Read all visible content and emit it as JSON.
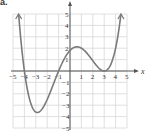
{
  "panel_label": "a.",
  "chart_data": {
    "type": "line",
    "title": "",
    "xlabel": "x",
    "ylabel": "y",
    "xlim": [
      -5,
      5
    ],
    "ylim": [
      -5,
      5
    ],
    "grid": true,
    "x_ticks": [
      -5,
      -4,
      -3,
      -2,
      -1,
      1,
      2,
      3,
      4,
      5
    ],
    "y_ticks": [
      -5,
      -4,
      -3,
      -2,
      -1,
      1,
      2,
      3,
      4,
      5
    ],
    "function": "f(x) = 0.05 (x+4)(x+1)(x-3)^2",
    "zeros": [
      -4,
      -1,
      3
    ],
    "key_points": [
      {
        "label": "local min",
        "x": -2.9,
        "y": -3.6
      },
      {
        "label": "y-intercept",
        "x": 0,
        "y": 1.8
      },
      {
        "label": "local max",
        "x": 0.7,
        "y": 2.1
      },
      {
        "label": "double root (touches)",
        "x": 3,
        "y": 0
      }
    ],
    "end_behavior": "both ends rise (arrows up)",
    "curve_color": "#7a7a7a",
    "grid_color": "#d8d8d8",
    "axis_color": "#555555"
  }
}
